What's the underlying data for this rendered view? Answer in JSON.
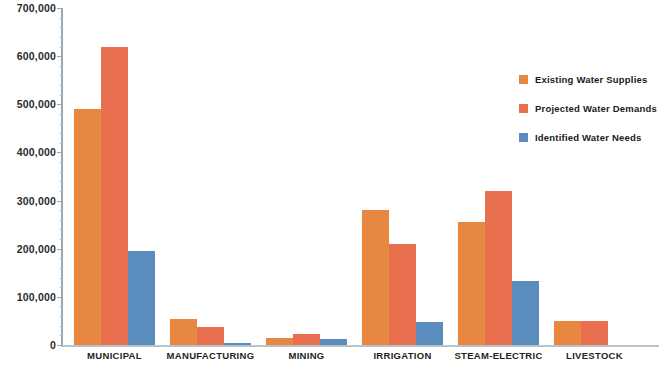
{
  "chart_data": {
    "type": "bar",
    "title": "",
    "subtitle": "",
    "xlabel": "",
    "ylabel": "",
    "ylim": [
      0,
      700000
    ],
    "ytick_interval": 100000,
    "grid": false,
    "legend_position": "right",
    "categories": [
      "MUNICIPAL",
      "MANUFACTURING",
      "MINING",
      "IRRIGATION",
      "STEAM-ELECTRIC",
      "LIVESTOCK"
    ],
    "ytick_labels": [
      "700,000",
      "600,000",
      "500,000",
      "400,000",
      "300,000",
      "200,000",
      "100,000",
      "0"
    ],
    "ytick_values": [
      700000,
      600000,
      500000,
      400000,
      300000,
      200000,
      100000,
      0
    ],
    "series": [
      {
        "name": "Existing Water Supplies",
        "color": "#e8873f",
        "values": [
          490000,
          55000,
          14000,
          280000,
          255000,
          50000
        ]
      },
      {
        "name": "Projected Water Demands",
        "color": "#e8704e",
        "values": [
          620000,
          37000,
          23000,
          210000,
          320000,
          50000
        ]
      },
      {
        "name": "Identified Water Needs",
        "color": "#5b8cbe",
        "values": [
          196000,
          5000,
          12000,
          47000,
          133000,
          null
        ]
      }
    ]
  },
  "legend": {
    "items": [
      {
        "label": "Existing Water Supplies",
        "swatch": "legend-swatch-orange"
      },
      {
        "label": "Projected Water Demands",
        "swatch": "legend-swatch-salmon"
      },
      {
        "label": "Identified Water Needs",
        "swatch": "legend-swatch-blue"
      }
    ]
  }
}
